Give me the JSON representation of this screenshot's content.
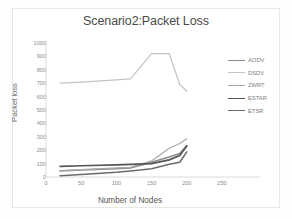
{
  "chart_data": {
    "type": "line",
    "title": "Scenario2:Packet Loss",
    "xlabel": "Number of Nodes",
    "ylabel": "Packet loss",
    "xlim": [
      0,
      250
    ],
    "ylim": [
      0,
      1000
    ],
    "xticks": [
      0,
      50,
      100,
      150,
      200,
      250
    ],
    "yticks": [
      0,
      100,
      200,
      300,
      400,
      500,
      600,
      700,
      800,
      900,
      1000
    ],
    "grid": false,
    "legend_position": "right",
    "x": [
      20,
      50,
      100,
      120,
      150,
      175,
      190,
      200
    ],
    "series": [
      {
        "name": "AODV",
        "color": "#8c8c8c",
        "width": 1.6,
        "values": [
          45,
          52,
          62,
          68,
          110,
          150,
          175,
          235
        ]
      },
      {
        "name": "DSDV",
        "color": "#c4c4c4",
        "width": 1.2,
        "values": [
          700,
          708,
          725,
          732,
          920,
          920,
          690,
          640
        ]
      },
      {
        "name": "ZWRT",
        "color": "#a8a8a8",
        "width": 1.2,
        "values": [
          48,
          55,
          68,
          72,
          120,
          215,
          250,
          285
        ]
      },
      {
        "name": "ESTAR",
        "color": "#555555",
        "width": 1.7,
        "values": [
          80,
          84,
          90,
          94,
          100,
          128,
          160,
          232
        ]
      },
      {
        "name": "ETSR",
        "color": "#6b6b6b",
        "width": 1.5,
        "values": [
          10,
          18,
          35,
          45,
          62,
          95,
          110,
          188
        ]
      }
    ]
  },
  "figure": {
    "background_color": "#fdfdfd",
    "plot_border_color": "#e8e8e8"
  }
}
